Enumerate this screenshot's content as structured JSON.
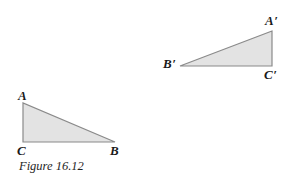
{
  "figure": {
    "caption": "Figure 16.12",
    "background_color": "#ffffff",
    "fill_color": "#e3e3e3",
    "stroke_color": "#8a8a8a",
    "label_color": "#1a1a1a",
    "width": 291,
    "height": 186
  },
  "triangles": [
    {
      "name": "triangle-ABC",
      "points": "23,103 23,142 115,142",
      "vertices": [
        {
          "label": "A",
          "prime": "",
          "x": 23,
          "y": 103
        },
        {
          "label": "C",
          "prime": "",
          "x": 23,
          "y": 142
        },
        {
          "label": "B",
          "prime": "",
          "x": 115,
          "y": 142
        }
      ]
    },
    {
      "name": "triangle-A-prime-B-prime-C-prime",
      "points": "272,31 180,66 272,66",
      "vertices": [
        {
          "label": "A",
          "prime": "′",
          "x": 272,
          "y": 31
        },
        {
          "label": "B",
          "prime": "′",
          "x": 180,
          "y": 66
        },
        {
          "label": "C",
          "prime": "′",
          "x": 272,
          "y": 66
        }
      ]
    }
  ],
  "labels": {
    "A": "A",
    "B": "B",
    "C": "C",
    "A_prime_letter": "A",
    "B_prime_letter": "B",
    "C_prime_letter": "C",
    "prime_mark": "′"
  }
}
